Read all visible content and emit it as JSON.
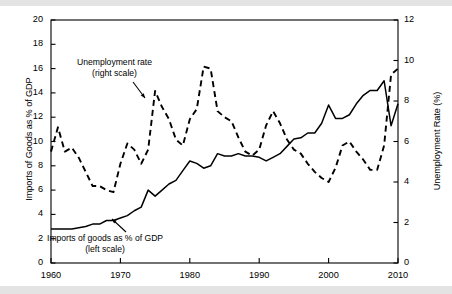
{
  "figure": {
    "background_color": "#ffffff",
    "band_color": "#e3e3e3",
    "line_color": "#000000"
  },
  "axes": {
    "left_title": "Imports of Goods as % of GDP",
    "right_title": "Unemployment Rate (%)",
    "left_ticks": [
      "0",
      "2",
      "4",
      "6",
      "8",
      "10",
      "12",
      "14",
      "16",
      "18",
      "20"
    ],
    "right_ticks": [
      "0",
      "2",
      "4",
      "6",
      "8",
      "10",
      "12"
    ],
    "x_ticks": [
      "1960",
      "1970",
      "1980",
      "1990",
      "2000",
      "2010"
    ]
  },
  "annotations": {
    "unemployment_line1": "Unemployment rate",
    "unemployment_line2": "(right scale)",
    "imports_line1": "Imports of goods as % of GDP",
    "imports_line2": "(left scale)"
  },
  "chart_data": {
    "type": "line",
    "title": "",
    "xlabel": "",
    "ylabel": "Imports of Goods as % of GDP",
    "y2label": "Unemployment Rate (%)",
    "xlim": [
      1960,
      2010
    ],
    "ylim": [
      0,
      20
    ],
    "y2lim": [
      0,
      12
    ],
    "grid": false,
    "legend": "annotations-on-plot",
    "x": [
      1960,
      1961,
      1962,
      1963,
      1964,
      1965,
      1966,
      1967,
      1968,
      1969,
      1970,
      1971,
      1972,
      1973,
      1974,
      1975,
      1976,
      1977,
      1978,
      1979,
      1980,
      1981,
      1982,
      1983,
      1984,
      1985,
      1986,
      1987,
      1988,
      1989,
      1990,
      1991,
      1992,
      1993,
      1994,
      1995,
      1996,
      1997,
      1998,
      1999,
      2000,
      2001,
      2002,
      2003,
      2004,
      2005,
      2006,
      2007,
      2008,
      2009,
      2010
    ],
    "series": [
      {
        "name": "Imports of goods as % of GDP",
        "axis": "left",
        "style": "solid",
        "values": [
          2.8,
          2.8,
          2.8,
          2.8,
          2.9,
          3.0,
          3.2,
          3.2,
          3.5,
          3.5,
          3.7,
          3.9,
          4.3,
          4.6,
          6.0,
          5.5,
          6.0,
          6.5,
          6.8,
          7.6,
          8.4,
          8.2,
          7.8,
          8.0,
          9.0,
          8.8,
          8.8,
          9.0,
          8.8,
          8.8,
          8.7,
          8.4,
          8.7,
          9.0,
          9.6,
          10.2,
          10.3,
          10.7,
          10.7,
          11.5,
          13.0,
          11.9,
          11.9,
          12.2,
          13.1,
          13.8,
          14.2,
          14.2,
          15.0,
          11.3,
          13.1
        ]
      },
      {
        "name": "Unemployment rate",
        "axis": "right",
        "style": "dashed",
        "values": [
          5.5,
          6.7,
          5.5,
          5.7,
          5.2,
          4.5,
          3.8,
          3.8,
          3.6,
          3.5,
          4.9,
          5.9,
          5.6,
          4.9,
          5.6,
          8.5,
          7.7,
          7.1,
          6.1,
          5.8,
          7.1,
          7.6,
          9.7,
          9.6,
          7.5,
          7.2,
          7.0,
          6.2,
          5.5,
          5.3,
          5.6,
          6.8,
          7.5,
          6.9,
          6.1,
          5.6,
          5.4,
          4.9,
          4.5,
          4.2,
          4.0,
          4.7,
          5.8,
          6.0,
          5.5,
          5.1,
          4.6,
          4.6,
          5.8,
          9.3,
          9.6
        ]
      }
    ]
  }
}
